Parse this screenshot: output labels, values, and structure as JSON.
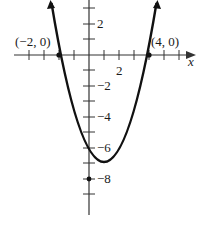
{
  "figure": {
    "function": "y = x^2 - 2x - 8",
    "x_axis_label": "x",
    "x_tick_labels": [
      {
        "value": 2,
        "text": "2"
      }
    ],
    "y_tick_labels": [
      {
        "value": 2,
        "text": "2"
      },
      {
        "value": -2,
        "text": "−2"
      },
      {
        "value": -4,
        "text": "−4"
      },
      {
        "value": -6,
        "text": "−6"
      },
      {
        "value": -8,
        "text": "−8"
      }
    ],
    "points": [
      {
        "label": "(−2, 0)",
        "x": -2,
        "y": 0
      },
      {
        "label": "(4, 0)",
        "x": 4,
        "y": 0
      },
      {
        "label": "",
        "x": 0,
        "y": -8
      }
    ],
    "colors": {
      "curve": "#111111",
      "axes": "#333333",
      "text": "#1a1a1a"
    }
  }
}
